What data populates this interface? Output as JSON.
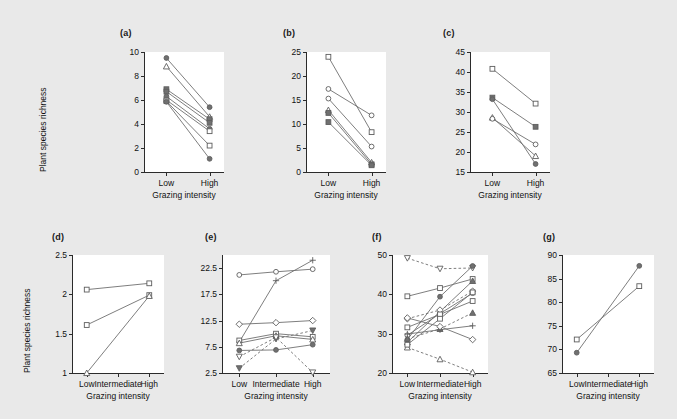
{
  "figure": {
    "background_color": "#e9e9e9",
    "plot_background_color": "#ffffff",
    "line_color": "#6f6f6f",
    "marker_stroke_color": "#5d5d5d",
    "axis_color": "#2b2b2b",
    "shared_y_axis_title": "Plant species richness",
    "shared_x_axis_title": "Grazing intensity"
  },
  "chart_data": [
    {
      "type": "line",
      "panel": "a",
      "title": "(a)",
      "xlabel": "Grazing intensity",
      "ylabel": "Plant species richness",
      "categories": [
        "Low",
        "High"
      ],
      "ylim": [
        0,
        10
      ],
      "yticks": [
        0,
        2,
        4,
        6,
        8,
        10
      ],
      "grid": false,
      "legend": "none",
      "series": [
        {
          "name": "s1",
          "marker": "filled-circle",
          "style": "solid",
          "values": [
            9.5,
            5.4
          ]
        },
        {
          "name": "s2",
          "marker": "open-triangle",
          "style": "solid",
          "values": [
            8.8,
            4.6
          ]
        },
        {
          "name": "s3",
          "marker": "filled-square",
          "style": "solid",
          "values": [
            6.9,
            4.4
          ]
        },
        {
          "name": "s4",
          "marker": "filled-square",
          "style": "solid",
          "values": [
            6.7,
            4.1
          ]
        },
        {
          "name": "s5",
          "marker": "filled-circle",
          "style": "solid",
          "values": [
            6.3,
            3.6
          ]
        },
        {
          "name": "s6",
          "marker": "open-square",
          "style": "solid",
          "values": [
            6.0,
            3.4
          ]
        },
        {
          "name": "s7",
          "marker": "open-square",
          "style": "solid",
          "values": [
            5.9,
            2.2
          ]
        },
        {
          "name": "s8",
          "marker": "filled-circle",
          "style": "solid",
          "values": [
            5.85,
            1.1
          ]
        }
      ]
    },
    {
      "type": "line",
      "panel": "b",
      "title": "(b)",
      "xlabel": "Grazing intensity",
      "ylabel": "Plant species richness",
      "categories": [
        "Low",
        "High"
      ],
      "ylim": [
        0,
        25
      ],
      "yticks": [
        0,
        5,
        10,
        15,
        20,
        25
      ],
      "grid": false,
      "legend": "none",
      "series": [
        {
          "name": "s1",
          "marker": "open-square",
          "style": "solid",
          "values": [
            24.0,
            8.3
          ]
        },
        {
          "name": "s2",
          "marker": "open-circle",
          "style": "solid",
          "values": [
            17.3,
            11.8
          ]
        },
        {
          "name": "s3",
          "marker": "open-circle",
          "style": "solid",
          "values": [
            15.3,
            5.3
          ]
        },
        {
          "name": "s4",
          "marker": "open-triangle",
          "style": "solid",
          "values": [
            12.9,
            2.0
          ]
        },
        {
          "name": "s5",
          "marker": "filled-square",
          "style": "solid",
          "values": [
            12.3,
            1.6
          ]
        },
        {
          "name": "s6",
          "marker": "filled-square",
          "style": "solid",
          "values": [
            10.4,
            1.4
          ]
        }
      ]
    },
    {
      "type": "line",
      "panel": "c",
      "title": "(c)",
      "xlabel": "Grazing intensity",
      "ylabel": "Plant species richness",
      "categories": [
        "Low",
        "High"
      ],
      "ylim": [
        15,
        45
      ],
      "yticks": [
        15,
        20,
        25,
        30,
        35,
        40,
        45
      ],
      "grid": false,
      "legend": "none",
      "series": [
        {
          "name": "s1",
          "marker": "open-square",
          "style": "solid",
          "values": [
            40.8,
            32.1
          ]
        },
        {
          "name": "s2",
          "marker": "filled-square",
          "style": "solid",
          "values": [
            33.6,
            26.3
          ]
        },
        {
          "name": "s3",
          "marker": "filled-circle",
          "style": "solid",
          "values": [
            33.2,
            17.0
          ]
        },
        {
          "name": "s4",
          "marker": "open-triangle",
          "style": "solid",
          "values": [
            28.6,
            19.0
          ]
        },
        {
          "name": "s5",
          "marker": "open-circle",
          "style": "solid",
          "values": [
            28.3,
            21.9
          ]
        }
      ]
    },
    {
      "type": "line",
      "panel": "d",
      "title": "(d)",
      "xlabel": "Grazing intensity",
      "ylabel": "Plant species richness",
      "categories": [
        "Low",
        "Intermediate",
        "High"
      ],
      "ylim": [
        1,
        2.5
      ],
      "yticks": [
        1,
        1.5,
        2,
        2.5
      ],
      "ytick_labels": [
        "1",
        "1.5",
        "2",
        "2.5"
      ],
      "grid": false,
      "legend": "none",
      "series": [
        {
          "name": "s1",
          "marker": "open-square",
          "style": "solid",
          "values": [
            2.06,
            null,
            2.14
          ]
        },
        {
          "name": "s2",
          "marker": "open-square",
          "style": "solid",
          "values": [
            1.61,
            null,
            1.99
          ]
        },
        {
          "name": "s3",
          "marker": "open-triangle",
          "style": "solid",
          "values": [
            1.0,
            null,
            1.98
          ]
        }
      ]
    },
    {
      "type": "line",
      "panel": "e",
      "title": "(e)",
      "xlabel": "Grazing intensity",
      "ylabel": "Plant species richness",
      "categories": [
        "Low",
        "Intermediate",
        "High"
      ],
      "ylim": [
        2.5,
        25
      ],
      "yticks": [
        2.5,
        7.5,
        12.5,
        17.5,
        22.5
      ],
      "ytick_labels": [
        "2.5",
        "7.5",
        "12.5",
        "17.5",
        "22.5"
      ],
      "grid": false,
      "legend": "none",
      "series": [
        {
          "name": "s1",
          "marker": "open-circle",
          "style": "solid",
          "values": [
            21.2,
            21.8,
            22.3
          ]
        },
        {
          "name": "s2",
          "marker": "plus",
          "style": "solid",
          "values": [
            8.4,
            20.1,
            24.0
          ]
        },
        {
          "name": "s3",
          "marker": "open-diamond",
          "style": "solid",
          "values": [
            11.8,
            12.1,
            12.5
          ]
        },
        {
          "name": "s4",
          "marker": "open-square",
          "style": "solid",
          "values": [
            8.7,
            10.0,
            9.4
          ]
        },
        {
          "name": "s5",
          "marker": "open-triangle",
          "style": "solid",
          "values": [
            8.2,
            9.6,
            8.9
          ]
        },
        {
          "name": "s6",
          "marker": "filled-circle",
          "style": "solid",
          "values": [
            6.8,
            6.9,
            7.9
          ]
        },
        {
          "name": "s7",
          "marker": "filled-down-triangle",
          "style": "dashed",
          "values": [
            3.4,
            9.0,
            10.6
          ]
        },
        {
          "name": "s8",
          "marker": "open-down-triangle",
          "style": "dashed",
          "values": [
            5.6,
            9.3,
            2.6
          ]
        }
      ]
    },
    {
      "type": "line",
      "panel": "f",
      "title": "(f)",
      "xlabel": "Grazing intensity",
      "ylabel": "Plant species richness",
      "categories": [
        "Low",
        "Intermediate",
        "High"
      ],
      "ylim": [
        20,
        50
      ],
      "yticks": [
        20,
        30,
        40,
        50
      ],
      "grid": false,
      "legend": "none",
      "series": [
        {
          "name": "s1",
          "marker": "open-down-triangle",
          "style": "dashed",
          "values": [
            49.2,
            46.5,
            46.7
          ]
        },
        {
          "name": "s2",
          "marker": "filled-circle",
          "style": "solid",
          "values": [
            28.5,
            39.4,
            47.2
          ]
        },
        {
          "name": "s3",
          "marker": "open-square",
          "style": "solid",
          "values": [
            39.5,
            41.6,
            43.9
          ]
        },
        {
          "name": "s4",
          "marker": "filled-triangle",
          "style": "solid",
          "values": [
            27.8,
            35.6,
            43.4
          ]
        },
        {
          "name": "s5",
          "marker": "open-circle",
          "style": "solid",
          "values": [
            29.6,
            35.1,
            40.3
          ]
        },
        {
          "name": "s6",
          "marker": "open-diamond",
          "style": "dashed",
          "values": [
            33.8,
            36.0,
            40.8
          ]
        },
        {
          "name": "s7",
          "marker": "open-square",
          "style": "solid",
          "values": [
            31.6,
            34.9,
            38.3
          ]
        },
        {
          "name": "s8",
          "marker": "filled-triangle",
          "style": "dashed",
          "values": [
            28.7,
            31.2,
            35.3
          ]
        },
        {
          "name": "s9",
          "marker": "plus",
          "style": "solid",
          "values": [
            29.9,
            31.0,
            32.0
          ]
        },
        {
          "name": "s10",
          "marker": "open-diamond",
          "style": "solid",
          "values": [
            34.0,
            31.8,
            28.5
          ]
        },
        {
          "name": "s11",
          "marker": "open-triangle",
          "style": "dashed",
          "values": [
            26.5,
            23.5,
            20.2
          ]
        },
        {
          "name": "s12",
          "marker": "open-square",
          "style": "solid",
          "values": [
            27.2,
            33.8,
            40.5
          ]
        }
      ]
    },
    {
      "type": "line",
      "panel": "g",
      "title": "(g)",
      "xlabel": "Grazing intensity",
      "ylabel": "Plant species richness",
      "categories": [
        "Low",
        "Intermediate",
        "High"
      ],
      "ylim": [
        65,
        90
      ],
      "yticks": [
        65,
        70,
        75,
        80,
        85,
        90
      ],
      "grid": false,
      "legend": "none",
      "series": [
        {
          "name": "s1",
          "marker": "filled-circle",
          "style": "solid",
          "values": [
            69.3,
            null,
            87.7
          ]
        },
        {
          "name": "s2",
          "marker": "open-square",
          "style": "solid",
          "values": [
            72.1,
            null,
            83.4
          ]
        }
      ]
    }
  ]
}
